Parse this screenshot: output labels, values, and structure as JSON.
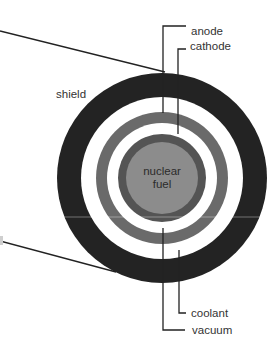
{
  "diagram": {
    "type": "cross-section",
    "colors": {
      "shield": "#232323",
      "gap": "#ffffff",
      "anode": "#6a6a6a",
      "cathode": "#545454",
      "fuel": "#8c8c8c",
      "text": "#333333",
      "lines": "#222222"
    },
    "layers": [
      {
        "name": "shield",
        "label": "shield"
      },
      {
        "name": "coolant",
        "label": "coolant"
      },
      {
        "name": "anode",
        "label": "anode"
      },
      {
        "name": "vacuum",
        "label": "vacuum"
      },
      {
        "name": "cathode",
        "label": "cathode"
      },
      {
        "name": "nuclear-fuel",
        "label_line1": "nuclear",
        "label_line2": "fuel"
      }
    ],
    "labels": {
      "anode": "anode",
      "cathode": "cathode",
      "shield": "shield",
      "fuel_line1": "nuclear",
      "fuel_line2": "fuel",
      "coolant": "coolant",
      "vacuum": "vacuum"
    }
  }
}
